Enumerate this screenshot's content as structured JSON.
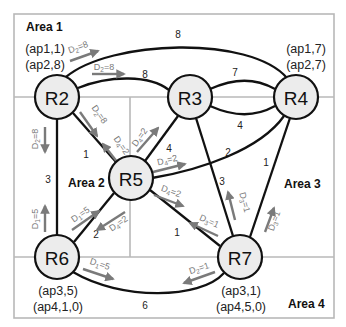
{
  "diagram": {
    "areas": [
      {
        "label": "Area 1"
      },
      {
        "label": "Area 2"
      },
      {
        "label": "Area 3"
      },
      {
        "label": "Area 4"
      }
    ],
    "nodes": [
      {
        "id": "R2",
        "label": "R2",
        "ap": [
          "(ap1,1)",
          "(ap2,8)"
        ]
      },
      {
        "id": "R3",
        "label": "R3"
      },
      {
        "id": "R4",
        "label": "R4",
        "ap": [
          "(ap1,7)",
          "(ap2,7)"
        ]
      },
      {
        "id": "R5",
        "label": "R5"
      },
      {
        "id": "R6",
        "label": "R6",
        "ap": [
          "(ap3,5)",
          "(ap4,1,0)"
        ]
      },
      {
        "id": "R7",
        "label": "R7",
        "ap": [
          "(ap3,1)",
          "(ap4,5,0)"
        ]
      }
    ],
    "edges": [
      {
        "from": "R2",
        "to": "R4",
        "weight": "8",
        "route": "outer arc"
      },
      {
        "from": "R2",
        "to": "R3",
        "weight": "8"
      },
      {
        "from": "R3",
        "to": "R4",
        "weight": "7",
        "route": "upper"
      },
      {
        "from": "R3",
        "to": "R4",
        "weight": "4",
        "route": "lower"
      },
      {
        "from": "R2",
        "to": "R5",
        "weight": "1"
      },
      {
        "from": "R2",
        "to": "R6",
        "weight": "3"
      },
      {
        "from": "R3",
        "to": "R5",
        "weight": "4"
      },
      {
        "from": "R3",
        "to": "R7",
        "weight": "3"
      },
      {
        "from": "R4",
        "to": "R5",
        "weight": "2"
      },
      {
        "from": "R4",
        "to": "R7",
        "weight": "1"
      },
      {
        "from": "R5",
        "to": "R6",
        "weight": "2"
      },
      {
        "from": "R5",
        "to": "R7",
        "weight": "1"
      },
      {
        "from": "R6",
        "to": "R7",
        "weight": "6"
      }
    ],
    "arrows": [
      {
        "label": "D",
        "sub": "2",
        "val": "=8",
        "note": "R2 to R4 over arc"
      },
      {
        "label": "D",
        "sub": "2",
        "val": "=8",
        "note": "R2 to R3"
      },
      {
        "label": "D",
        "sub": "2",
        "val": "=8",
        "note": "R2 to R5"
      },
      {
        "label": "D",
        "sub": "2",
        "val": "=8",
        "note": "R2 to R6"
      },
      {
        "label": "D",
        "sub": "4",
        "val": "=2",
        "note": "R5 to R2"
      },
      {
        "label": "D",
        "sub": "4",
        "val": "=2",
        "note": "R5 to R3"
      },
      {
        "label": "D",
        "sub": "4",
        "val": "=2",
        "note": "R5 to R4"
      },
      {
        "label": "D",
        "sub": "4",
        "val": "=2",
        "note": "R5 to R7"
      },
      {
        "label": "D",
        "sub": "4",
        "val": "=2",
        "note": "R5 to R6"
      },
      {
        "label": "D",
        "sub": "1",
        "val": "=5",
        "note": "R6 to R2"
      },
      {
        "label": "D",
        "sub": "1",
        "val": "=5",
        "note": "R6 to R5"
      },
      {
        "label": "D",
        "sub": "1",
        "val": "=5",
        "note": "R6 to R7"
      },
      {
        "label": "D",
        "sub": "3",
        "val": "=1",
        "note": "R7 to R5"
      },
      {
        "label": "D",
        "sub": "3",
        "val": "=1",
        "note": "R7 to R3"
      },
      {
        "label": "D",
        "sub": "3",
        "val": "=1",
        "note": "R7 to R4"
      },
      {
        "label": "D",
        "sub": "2",
        "val": "=1",
        "note": "R7 to R6"
      }
    ]
  }
}
